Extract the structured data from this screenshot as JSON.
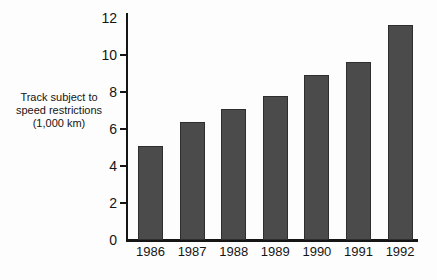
{
  "chart_data": {
    "type": "bar",
    "title": "",
    "categories": [
      "1986",
      "1987",
      "1988",
      "1989",
      "1990",
      "1991",
      "1992"
    ],
    "values": [
      5.1,
      6.4,
      7.1,
      7.8,
      8.9,
      9.6,
      11.6
    ],
    "xlabel": "",
    "ylabel": "Track subject to\nspeed restrictions\n(1,000 km)",
    "ylim": [
      0,
      12
    ],
    "yticks": [
      0,
      2,
      4,
      6,
      8,
      10,
      12
    ],
    "grid": false,
    "legend": null,
    "bar_color": "#4b4b4b",
    "axis_color": "#151515",
    "background_color": "#fdfdfd"
  }
}
